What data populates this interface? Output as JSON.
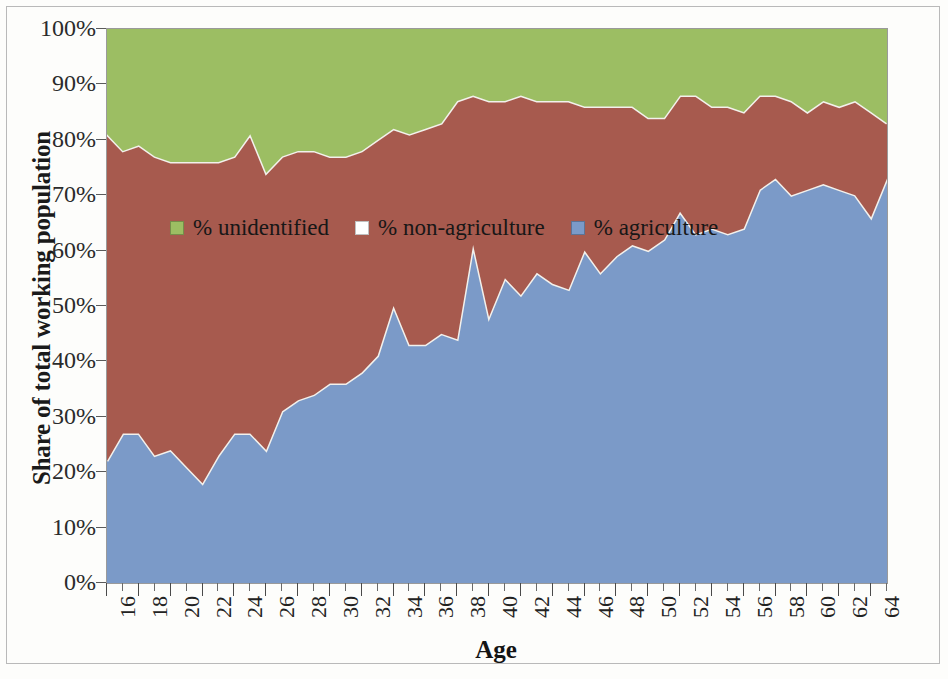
{
  "chart_data": {
    "type": "area",
    "stacked": true,
    "stack_order": [
      "% agriculture",
      "% non-agriculture",
      "% unidentified"
    ],
    "title": "",
    "xlabel": "Age",
    "ylabel": "Share of total working population",
    "xlim": [
      16,
      65
    ],
    "ylim": [
      0,
      100
    ],
    "grid": false,
    "legend_position": "inside-upper-left",
    "y_tick_labels": [
      "100%",
      "90%",
      "80%",
      "70%",
      "60%",
      "50%",
      "40%",
      "30%",
      "20%",
      "10%",
      "0%"
    ],
    "y_tick_values": [
      100,
      90,
      80,
      70,
      60,
      50,
      40,
      30,
      20,
      10,
      0
    ],
    "x_tick_labels": [
      "16",
      "18",
      "20",
      "22",
      "24",
      "26",
      "28",
      "30",
      "32",
      "34",
      "36",
      "38",
      "40",
      "42",
      "44",
      "46",
      "48",
      "50",
      "52",
      "54",
      "56",
      "58",
      "60",
      "62",
      "64"
    ],
    "x_tick_values": [
      16,
      18,
      20,
      22,
      24,
      26,
      28,
      30,
      32,
      34,
      36,
      38,
      40,
      42,
      44,
      46,
      48,
      50,
      52,
      54,
      56,
      58,
      60,
      62,
      64
    ],
    "x": [
      16,
      17,
      18,
      19,
      20,
      21,
      22,
      23,
      24,
      25,
      26,
      27,
      28,
      29,
      30,
      31,
      32,
      33,
      34,
      35,
      36,
      37,
      38,
      39,
      40,
      41,
      42,
      43,
      44,
      45,
      46,
      47,
      48,
      49,
      50,
      51,
      52,
      53,
      54,
      55,
      56,
      57,
      58,
      59,
      60,
      61,
      62,
      63,
      64,
      65
    ],
    "series": [
      {
        "name": "% agriculture",
        "color": "#7b9ac8",
        "values": [
          22,
          27,
          27,
          23,
          24,
          21,
          18,
          23,
          27,
          27,
          24,
          31,
          33,
          34,
          36,
          36,
          38,
          41,
          50,
          43,
          43,
          45,
          44,
          61,
          48,
          55,
          52,
          56,
          54,
          53,
          60,
          56,
          59,
          61,
          60,
          62,
          67,
          63,
          64,
          63,
          64,
          71,
          73,
          70,
          71,
          72,
          71,
          70,
          66,
          73
        ]
      },
      {
        "name": "% non-agriculture",
        "color": "#a75a4e",
        "values": [
          59,
          51,
          52,
          54,
          52,
          55,
          58,
          53,
          50,
          54,
          50,
          46,
          45,
          44,
          41,
          41,
          40,
          39,
          32,
          38,
          39,
          38,
          43,
          27,
          39,
          32,
          36,
          31,
          33,
          34,
          26,
          30,
          27,
          25,
          24,
          22,
          21,
          25,
          22,
          23,
          21,
          17,
          15,
          17,
          14,
          15,
          15,
          17,
          19,
          10
        ]
      },
      {
        "name": "% unidentified",
        "color": "#9cbe63",
        "values": [
          19,
          22,
          21,
          23,
          24,
          24,
          24,
          24,
          23,
          19,
          26,
          23,
          22,
          22,
          23,
          23,
          22,
          20,
          18,
          19,
          18,
          17,
          13,
          12,
          13,
          13,
          12,
          13,
          13,
          13,
          14,
          14,
          14,
          14,
          16,
          16,
          12,
          12,
          14,
          14,
          15,
          12,
          12,
          13,
          15,
          13,
          14,
          13,
          15,
          17
        ]
      }
    ]
  },
  "axis": {
    "y_title": "Share of total working population",
    "x_title": "Age"
  },
  "legend": {
    "items": [
      {
        "label": "% unidentified",
        "color": "#9cbe63"
      },
      {
        "label": "% non-agriculture",
        "color": "#ffffff"
      },
      {
        "label": "% agriculture",
        "color": "#7b9ac8"
      }
    ]
  },
  "colors": {
    "agriculture": "#7b9ac8",
    "non_agriculture": "#a75a4e",
    "unidentified": "#9cbe63",
    "separator": "#f3f1ec",
    "plot_border": "#9a9a9a",
    "figure_border": "#b9b9b9"
  }
}
